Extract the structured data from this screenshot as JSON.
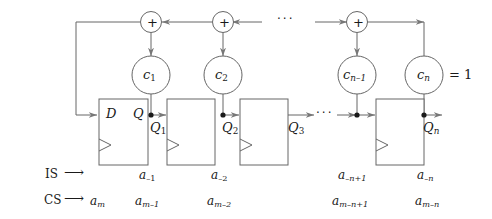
{
  "diagram": {
    "stroke_color": "#555555",
    "text_color": "#1a1a1a",
    "background": "#ffffff",
    "adders": [
      {
        "name": "adder-1",
        "symbol": "+"
      },
      {
        "name": "adder-2",
        "symbol": "+"
      },
      {
        "name": "adder-n-1",
        "symbol": "+"
      }
    ],
    "coefficients": [
      {
        "name": "c1",
        "base": "c",
        "sub": "1"
      },
      {
        "name": "c2",
        "base": "c",
        "sub": "2"
      },
      {
        "name": "cn-1",
        "base": "c",
        "sub": "n–1"
      },
      {
        "name": "cn",
        "base": "c",
        "sub": "n"
      }
    ],
    "cn_value_label": "= 1",
    "flipflops": [
      {
        "name": "ff-1",
        "d_label": "D",
        "q_label": "Q"
      },
      {
        "name": "ff-2",
        "d_label": "",
        "q_label": ""
      },
      {
        "name": "ff-3",
        "d_label": "",
        "q_label": ""
      },
      {
        "name": "ff-n",
        "d_label": "",
        "q_label": ""
      }
    ],
    "q_outputs": [
      {
        "name": "q1",
        "base": "Q",
        "sub": "1"
      },
      {
        "name": "q2",
        "base": "Q",
        "sub": "2"
      },
      {
        "name": "q3",
        "base": "Q",
        "sub": "3"
      },
      {
        "name": "qn",
        "base": "Q",
        "sub": "n"
      }
    ],
    "input_rows": [
      {
        "name": "is-row",
        "label": "IS",
        "arrow": "⟶"
      },
      {
        "name": "cs-row",
        "label": "CS",
        "arrow": "⟶"
      }
    ],
    "is_cells": [
      {
        "name": "is-cell-0",
        "base": "",
        "sub": ""
      },
      {
        "name": "is-cell-1",
        "base": "a",
        "sub": "–1"
      },
      {
        "name": "is-cell-2",
        "base": "a",
        "sub": "–2"
      },
      {
        "name": "is-cell-n1",
        "base": "a",
        "sub": "–n+1"
      },
      {
        "name": "is-cell-n",
        "base": "a",
        "sub": "–n"
      }
    ],
    "cs_cells": [
      {
        "name": "cs-cell-0",
        "base": "a",
        "sub": "m"
      },
      {
        "name": "cs-cell-1",
        "base": "a",
        "sub": "m–1"
      },
      {
        "name": "cs-cell-2",
        "base": "a",
        "sub": "m–2"
      },
      {
        "name": "cs-cell-n1",
        "base": "a",
        "sub": "m–n+1"
      },
      {
        "name": "cs-cell-n",
        "base": "a",
        "sub": "m–n"
      }
    ],
    "ellipses": [
      {
        "name": "ellipsis-top",
        "text": "···"
      },
      {
        "name": "ellipsis-mid",
        "text": "···"
      },
      {
        "name": "ellipsis-left",
        "text": "···"
      }
    ]
  }
}
